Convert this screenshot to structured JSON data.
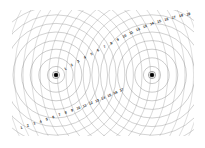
{
  "figure": {
    "background_color": "#ffffff",
    "wave_line_color": "#8a8a8a",
    "source_color": "#000000",
    "label_color": "#2c2c2c",
    "canvas": {
      "width": 205,
      "height": 148
    }
  },
  "clip_region": {
    "x": 12,
    "y": 10,
    "width": 182,
    "height": 126
  },
  "sources": [
    {
      "name": "source-left",
      "cx": 56,
      "cy": 75,
      "dot_radius": 2.0,
      "ring_radius": 3.6
    },
    {
      "name": "source-right",
      "cx": 152,
      "cy": 75,
      "dot_radius": 2.0,
      "ring_radius": 3.6
    }
  ],
  "wavefronts": {
    "count_per_source": 17,
    "spacing": 8.6,
    "first_radius": 8.6
  },
  "fringe_labels_top": {
    "values": [
      "1",
      "2",
      "3",
      "4",
      "5",
      "6",
      "7",
      "8",
      "9",
      "10",
      "11",
      "12",
      "13",
      "14",
      "15",
      "16",
      "17",
      "18",
      "19"
    ],
    "path_id": "label-path-top"
  },
  "fringe_labels_bottom": {
    "values": [
      "1",
      "2",
      "3",
      "4",
      "5",
      "6",
      "7",
      "8",
      "9",
      "10",
      "11",
      "12",
      "13",
      "14",
      "15",
      "16",
      "17"
    ],
    "path_id": "label-path-bottom"
  },
  "chart_data": {
    "type": "scatter",
    "subtitle": "",
    "xlabel": "",
    "ylabel": "",
    "xlim": [
      0,
      205
    ],
    "ylim": [
      0,
      148
    ],
    "grid": false,
    "legend": null,
    "annotations": [
      "Numbered fringe orders 1 through 19 along the upper-right hyperbolic arc",
      "Numbered fringe orders 1 through 17 along the lower-left hyperbolic arc"
    ],
    "series": [
      {
        "name": "source-left-wavefronts",
        "center": [
          56,
          75
        ],
        "radii": [
          8.6,
          17.2,
          25.8,
          34.4,
          43.0,
          51.6,
          60.2,
          68.8,
          77.4,
          86.0,
          94.6,
          103.2,
          111.8,
          120.4,
          129.0,
          137.6,
          146.2
        ]
      },
      {
        "name": "source-right-wavefronts",
        "center": [
          152,
          75
        ],
        "radii": [
          8.6,
          17.2,
          25.8,
          34.4,
          43.0,
          51.6,
          60.2,
          68.8,
          77.4,
          86.0,
          94.6,
          103.2,
          111.8,
          120.4,
          129.0,
          137.6,
          146.2
        ]
      }
    ],
    "fringe_orders_top": [
      1,
      2,
      3,
      4,
      5,
      6,
      7,
      8,
      9,
      10,
      11,
      12,
      13,
      14,
      15,
      16,
      17,
      18,
      19
    ],
    "fringe_orders_bottom": [
      1,
      2,
      3,
      4,
      5,
      6,
      7,
      8,
      9,
      10,
      11,
      12,
      13,
      14,
      15,
      16,
      17
    ]
  }
}
